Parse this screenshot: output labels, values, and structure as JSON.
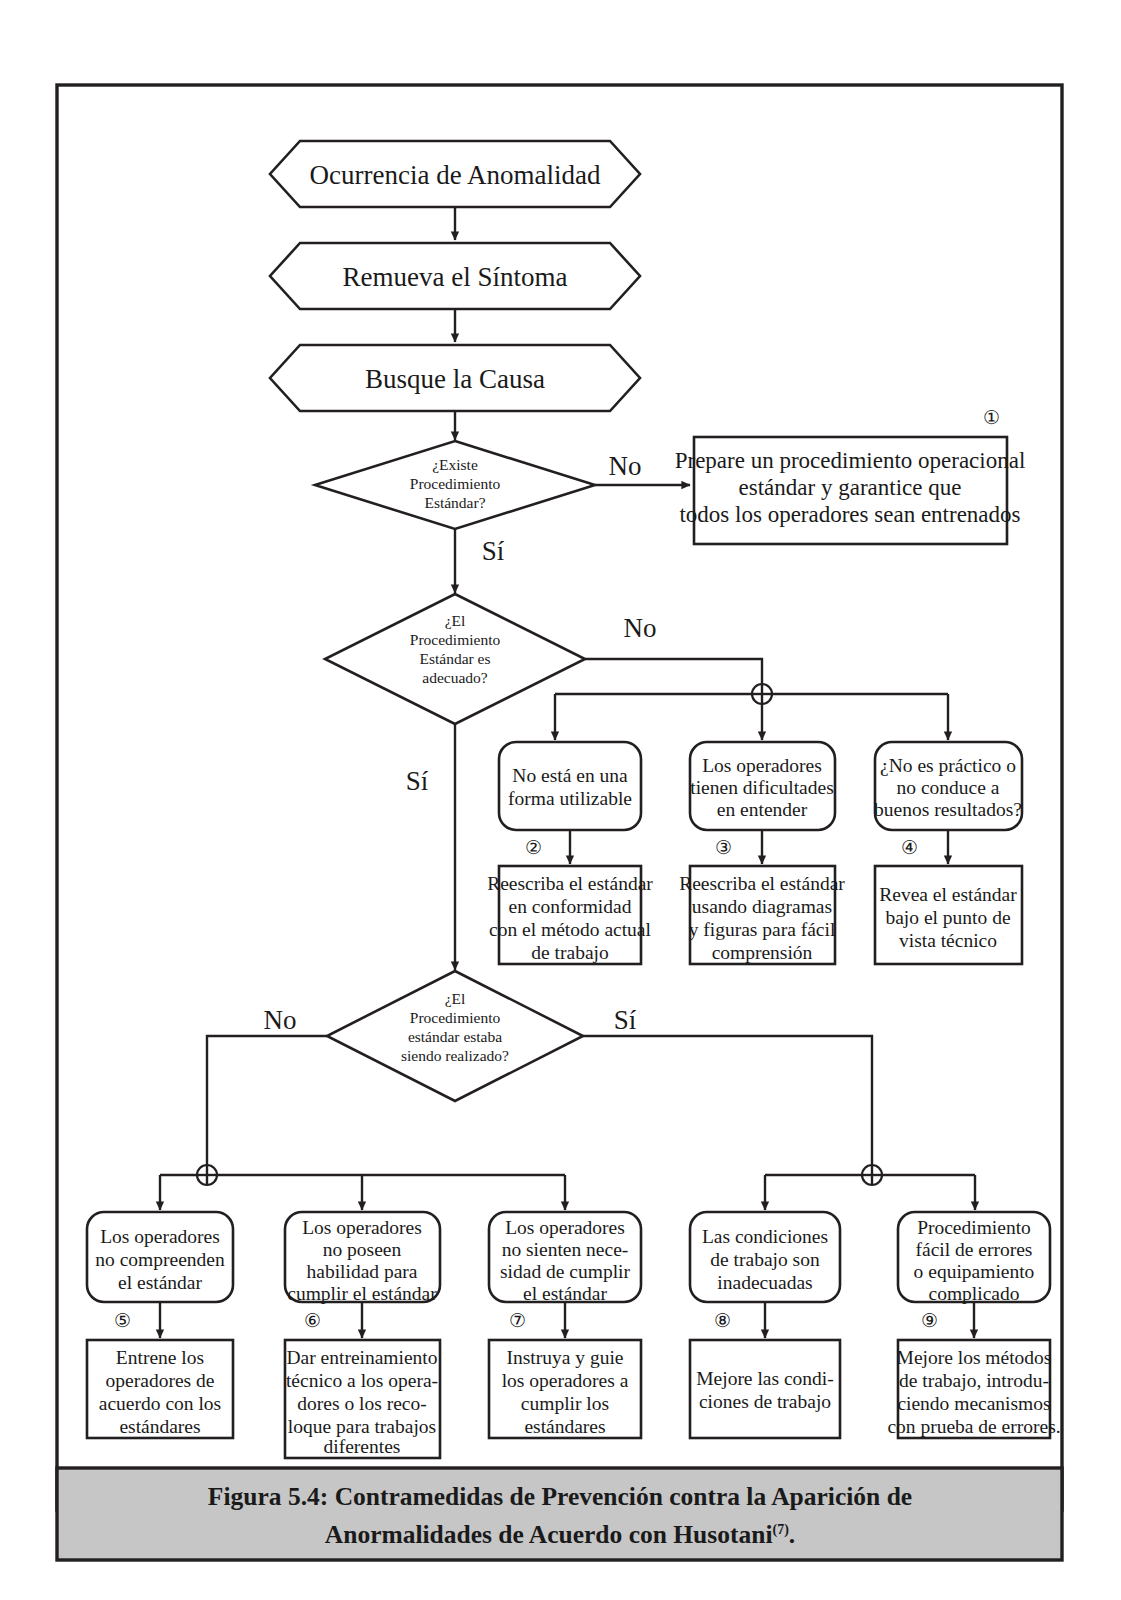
{
  "figure": {
    "caption_line1": "Figura 5.4: Contramedidas de Prevención contra la Aparición de",
    "caption_line2": "Anormalidades de Acuerdo con Husotani",
    "caption_superscript": "(7)",
    "caption_end": ".",
    "caption_background": "#c6c6c6",
    "ink_color": "#231f20"
  },
  "flow": {
    "start_nodes": [
      {
        "id": "n1",
        "label": "Ocurrencia de Anomalidad",
        "shape": "hexagon"
      },
      {
        "id": "n2",
        "label": "Remueva el Síntoma",
        "shape": "hexagon"
      },
      {
        "id": "n3",
        "label": "Busque la Causa",
        "shape": "hexagon"
      }
    ],
    "decisions": [
      {
        "id": "d1",
        "lines": [
          "¿Existe",
          "Procedimiento",
          "Estándar?"
        ],
        "branch_right": "No",
        "branch_down": "Sí"
      },
      {
        "id": "d2",
        "lines": [
          "¿El",
          "Procedimiento",
          "Estándar es",
          "adecuado?"
        ],
        "branch_right": "No",
        "branch_down": "Sí"
      },
      {
        "id": "d3",
        "lines": [
          "¿El",
          "Procedimiento",
          "estándar estaba",
          "siendo realizado?"
        ],
        "branch_left": "No",
        "branch_right": "Sí"
      }
    ],
    "action_top": {
      "number": "①",
      "lines": [
        "Prepare un procedimiento operacional",
        "estándar y garantice que",
        "todos los operadores sean entrenados"
      ]
    },
    "middle_causes": [
      {
        "id": "c2",
        "lines": [
          "No está en una",
          "forma utilizable"
        ]
      },
      {
        "id": "c3",
        "lines": [
          "Los operadores",
          "tienen dificultades",
          "en entender"
        ]
      },
      {
        "id": "c4",
        "lines": [
          "¿No es práctico o",
          "no conduce a",
          "buenos resultados?"
        ]
      }
    ],
    "middle_actions": [
      {
        "number": "②",
        "lines": [
          "Reescriba el estándar",
          "en conformidad",
          "con el método actual",
          "de trabajo"
        ]
      },
      {
        "number": "③",
        "lines": [
          "Reescriba el estándar",
          "usando diagramas",
          "y figuras para fácil",
          "comprensión"
        ]
      },
      {
        "number": "④",
        "lines": [
          "Revea el estándar",
          "bajo el punto de",
          "vista técnico"
        ]
      }
    ],
    "bottom_causes": [
      {
        "id": "c5",
        "lines": [
          "Los operadores",
          "no compreenden",
          "el estándar"
        ]
      },
      {
        "id": "c6",
        "lines": [
          "Los operadores",
          "no poseen",
          "habilidad para",
          "cumplir el estándar"
        ]
      },
      {
        "id": "c7",
        "lines": [
          "Los operadores",
          "no sienten nece-",
          "sidad de cumplir",
          "el estándar"
        ]
      },
      {
        "id": "c8",
        "lines": [
          "Las condiciones",
          "de trabajo son",
          "inadecuadas"
        ]
      },
      {
        "id": "c9",
        "lines": [
          "Procedimiento",
          "fácil de errores",
          "o equipamiento",
          "complicado"
        ]
      }
    ],
    "bottom_actions": [
      {
        "number": "⑤",
        "lines": [
          "Entrene los",
          "operadores de",
          "acuerdo con los",
          "estándares"
        ]
      },
      {
        "number": "⑥",
        "lines": [
          "Dar entreinamiento",
          "técnico a los opera-",
          "dores o los reco-",
          "loque para trabajos",
          "diferentes"
        ]
      },
      {
        "number": "⑦",
        "lines": [
          "Instruya y guie",
          "los operadores a",
          "cumplir los",
          "estándares"
        ]
      },
      {
        "number": "⑧",
        "lines": [
          "Mejore las condi-",
          "ciones de trabajo"
        ]
      },
      {
        "number": "⑨",
        "lines": [
          "Mejore los métodos",
          "de trabajo, introdu-",
          "ciendo mecanismos",
          "con prueba de errores."
        ]
      }
    ],
    "junctions": [
      {
        "id": "j1",
        "glyph": "circled-plus"
      },
      {
        "id": "j2",
        "glyph": "circled-plus"
      },
      {
        "id": "j3",
        "glyph": "circled-plus"
      }
    ]
  }
}
